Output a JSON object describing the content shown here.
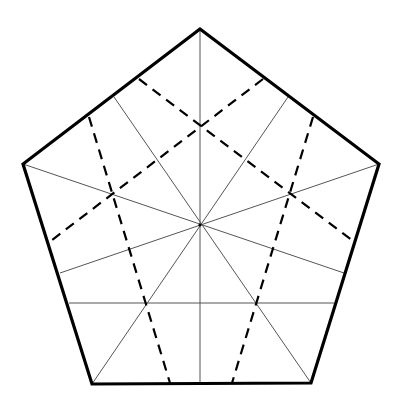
{
  "diagram": {
    "type": "geometric-construction",
    "shape": "regular-pentagon",
    "colors": {
      "background": "#ffffff",
      "outline": "#000000",
      "thin_line": "#555555",
      "dashed_line": "#000000"
    },
    "vertices": [
      {
        "name": "top",
        "x": 200,
        "y": 29
      },
      {
        "name": "upper-right",
        "x": 379,
        "y": 164
      },
      {
        "name": "lower-right",
        "x": 311,
        "y": 383
      },
      {
        "name": "lower-left",
        "x": 92,
        "y": 384
      },
      {
        "name": "upper-left",
        "x": 23,
        "y": 164
      }
    ],
    "center": {
      "x": 200,
      "y": 225
    },
    "thin_lines": [
      {
        "name": "vertical-axis",
        "x1": 200,
        "y1": 29,
        "x2": 200,
        "y2": 384
      },
      {
        "name": "ray-upper-left-vertex",
        "x1": 23,
        "y1": 164,
        "x2": 344,
        "y2": 273
      },
      {
        "name": "ray-upper-right-vertex",
        "x1": 379,
        "y1": 164,
        "x2": 60,
        "y2": 273
      },
      {
        "name": "ray-lower-left-vertex",
        "x1": 92,
        "y1": 384,
        "x2": 288,
        "y2": 97
      },
      {
        "name": "ray-lower-right-vertex",
        "x1": 311,
        "y1": 383,
        "x2": 114,
        "y2": 97
      },
      {
        "name": "horizontal-lower",
        "x1": 69,
        "y1": 303,
        "x2": 334,
        "y2": 303
      }
    ],
    "dashed_lines": [
      {
        "name": "dash-upper-left-diag",
        "x1": 139,
        "y1": 79,
        "x2": 353,
        "y2": 241
      },
      {
        "name": "dash-upper-right-diag",
        "x1": 263,
        "y1": 79,
        "x2": 52,
        "y2": 240
      },
      {
        "name": "dash-left-near-vertical",
        "x1": 89,
        "y1": 117,
        "x2": 170,
        "y2": 383
      },
      {
        "name": "dash-right-near-vertical",
        "x1": 313,
        "y1": 117,
        "x2": 232,
        "y2": 383
      }
    ],
    "intersections": [
      {
        "name": "top-cross",
        "x": 200,
        "y": 125
      },
      {
        "name": "left-cross",
        "x": 112,
        "y": 194
      },
      {
        "name": "right-cross",
        "x": 290,
        "y": 194
      }
    ]
  }
}
